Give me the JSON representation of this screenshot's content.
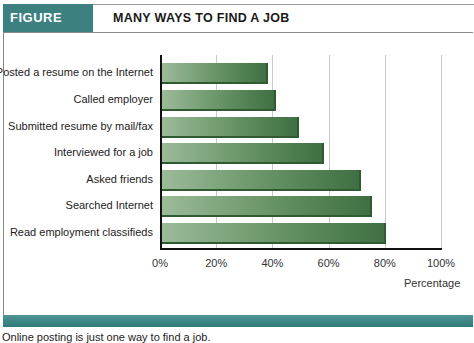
{
  "figure": {
    "label": "FIGURE 11.13",
    "title": "MANY WAYS TO FIND A JOB",
    "caption": "Online posting is just one way to find a job.",
    "accent_color": "#3d8080",
    "bar_color": "#5a8a5a"
  },
  "chart_data": {
    "type": "bar",
    "orientation": "horizontal",
    "title": "MANY WAYS TO FIND A JOB",
    "categories": [
      "Posted a resume on the Internet",
      "Called employer",
      "Submitted resume by mail/fax",
      "Interviewed for a job",
      "Asked friends",
      "Searched Internet",
      "Read employment classifieds"
    ],
    "values": [
      38,
      41,
      49,
      58,
      71,
      75,
      80
    ],
    "xlabel": "Percentage",
    "ylabel": "",
    "xlim": [
      0,
      100
    ],
    "xticks": [
      "0%",
      "20%",
      "40%",
      "60%",
      "80%",
      "100%"
    ],
    "grid": true,
    "legend": "none"
  }
}
